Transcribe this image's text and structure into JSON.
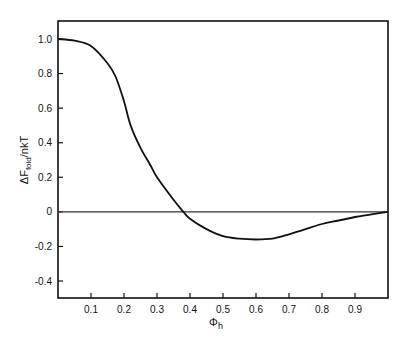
{
  "chart_data": {
    "type": "line",
    "title": "",
    "xlabel": "Φ",
    "xlabel_sub": "h",
    "ylabel_prefix": "ΔF",
    "ylabel_sub": "fold",
    "ylabel_suffix": "/nkT",
    "xlim": [
      0,
      1.0
    ],
    "ylim": [
      -0.5,
      1.1
    ],
    "x_ticks": [
      0.1,
      0.2,
      0.3,
      0.4,
      0.5,
      0.6,
      0.7,
      0.8,
      0.9
    ],
    "x_tick_labels": [
      "0.1",
      "0.2",
      "0.3",
      "0.4",
      "0.5",
      "0.6",
      "0.7",
      "0.8",
      "0.9"
    ],
    "y_ticks": [
      1.0,
      0.8,
      0.6,
      0.4,
      0.2,
      0,
      -0.2,
      -0.4
    ],
    "y_tick_labels": [
      "1.0",
      "0.8",
      "0.6",
      "0.4",
      "0.2",
      "0",
      "-0.2",
      "-0.4"
    ],
    "grid": false,
    "reference_line": 0,
    "series": [
      {
        "name": "ΔF_fold/nkT",
        "x": [
          0.0,
          0.05,
          0.1,
          0.15,
          0.175,
          0.2,
          0.22,
          0.25,
          0.28,
          0.3,
          0.35,
          0.38,
          0.4,
          0.45,
          0.5,
          0.55,
          0.6,
          0.65,
          0.7,
          0.75,
          0.8,
          0.85,
          0.9,
          0.95,
          1.0
        ],
        "values": [
          1.0,
          0.99,
          0.96,
          0.86,
          0.78,
          0.64,
          0.5,
          0.37,
          0.27,
          0.2,
          0.07,
          0.0,
          -0.04,
          -0.1,
          -0.14,
          -0.155,
          -0.16,
          -0.155,
          -0.13,
          -0.1,
          -0.07,
          -0.05,
          -0.03,
          -0.015,
          0.0
        ]
      }
    ]
  }
}
